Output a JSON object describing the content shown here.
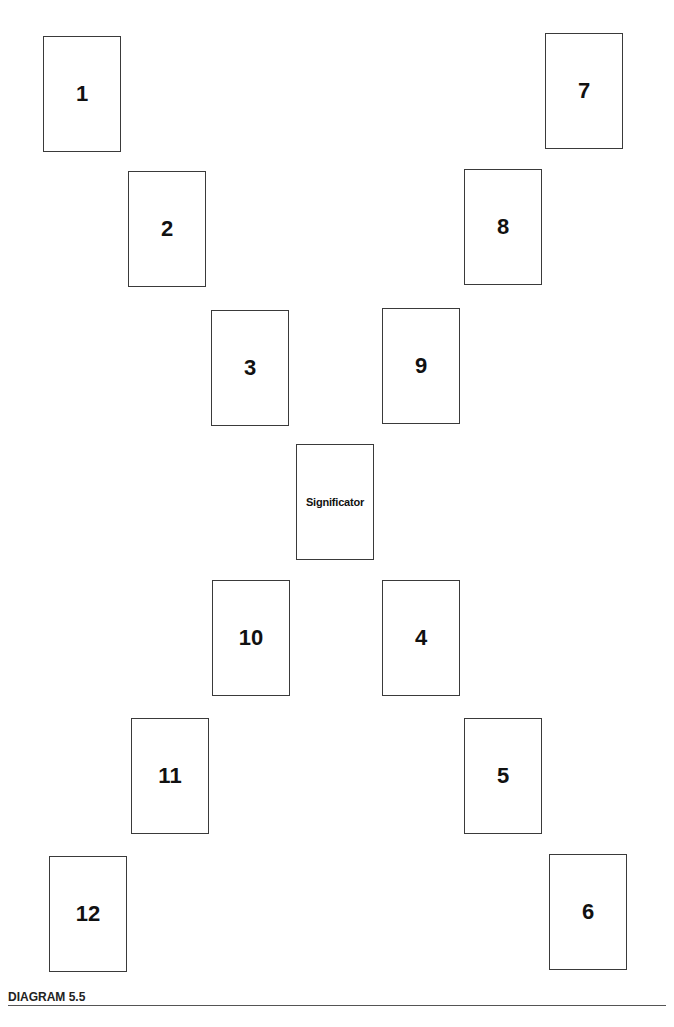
{
  "diagram": {
    "caption": "DIAGRAM 5.5",
    "cards": [
      {
        "label": "1",
        "x": 43,
        "y": 36
      },
      {
        "label": "2",
        "x": 128,
        "y": 171
      },
      {
        "label": "3",
        "x": 211,
        "y": 310
      },
      {
        "label": "Significator",
        "x": 296,
        "y": 444
      },
      {
        "label": "4",
        "x": 382,
        "y": 580
      },
      {
        "label": "5",
        "x": 464,
        "y": 718
      },
      {
        "label": "6",
        "x": 549,
        "y": 854
      },
      {
        "label": "7",
        "x": 545,
        "y": 33
      },
      {
        "label": "8",
        "x": 464,
        "y": 169
      },
      {
        "label": "9",
        "x": 382,
        "y": 308
      },
      {
        "label": "10",
        "x": 212,
        "y": 580
      },
      {
        "label": "11",
        "x": 131,
        "y": 718
      },
      {
        "label": "12",
        "x": 49,
        "y": 856
      }
    ]
  }
}
